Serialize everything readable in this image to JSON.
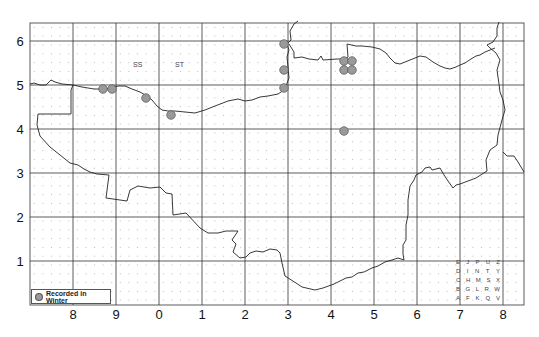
{
  "map": {
    "type": "distribution-grid-map",
    "y_axis_labels": [
      "6",
      "5",
      "4",
      "3",
      "2",
      "1"
    ],
    "x_axis_labels": [
      "8",
      "9",
      "0",
      "1",
      "2",
      "3",
      "4",
      "5",
      "6",
      "7",
      "8"
    ],
    "square_labels": [
      {
        "text": "SS",
        "x": 136,
        "y": 64
      },
      {
        "text": "ST",
        "x": 178,
        "y": 64
      }
    ],
    "legend": {
      "label": "Recorded in Winter",
      "marker_color": "#999999"
    },
    "tetrad_key": {
      "rows": [
        [
          "E",
          "J",
          "P",
          "U",
          "Z"
        ],
        [
          "D",
          "I",
          "N",
          "T",
          "Y"
        ],
        [
          "C",
          "H",
          "M",
          "S",
          "X"
        ],
        [
          "B",
          "G",
          "L",
          "R",
          "W"
        ],
        [
          "A",
          "F",
          "K",
          "Q",
          "V"
        ]
      ]
    },
    "records": [
      {
        "x": 103,
        "y": 89
      },
      {
        "x": 112,
        "y": 89
      },
      {
        "x": 146,
        "y": 98
      },
      {
        "x": 171,
        "y": 115
      },
      {
        "x": 284,
        "y": 44
      },
      {
        "x": 284,
        "y": 70
      },
      {
        "x": 284,
        "y": 88
      },
      {
        "x": 344,
        "y": 61
      },
      {
        "x": 352,
        "y": 61
      },
      {
        "x": 344,
        "y": 70
      },
      {
        "x": 352,
        "y": 70
      },
      {
        "x": 344,
        "y": 131
      }
    ],
    "colors": {
      "grid": "#333333",
      "boundary": "#222222",
      "dot_grid": "#b5b5b5",
      "record_fill": "#9a9a9a",
      "record_stroke": "#555555"
    }
  }
}
